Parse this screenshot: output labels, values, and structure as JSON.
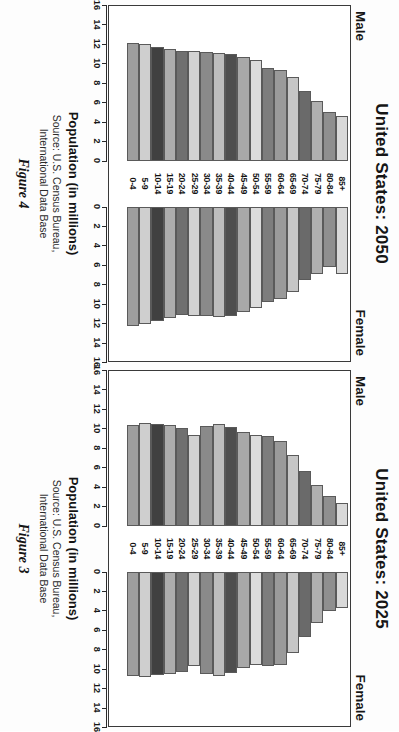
{
  "page": {
    "axis_title": "Population (in millions)",
    "source_line1": "Source: U.S. Census Bureau,",
    "source_line2": "International Data Base",
    "male_label": "Male",
    "female_label": "Female"
  },
  "panels": [
    {
      "id": "us-2025",
      "title": "United States: 2025",
      "figure_caption": "Figure 3"
    },
    {
      "id": "us-2050",
      "title": "United States: 2050",
      "figure_caption": "Figure 4"
    }
  ],
  "chart_data": [
    {
      "type": "bar",
      "title": "United States: 2025",
      "subtitle": "Figure 3",
      "orientation": "horizontal",
      "layout": "population-pyramid",
      "xlabel": "Population (in millions)",
      "ylabel": "",
      "xlim": [
        0,
        16
      ],
      "xticks": [
        0,
        2,
        4,
        6,
        8,
        10,
        12,
        14,
        16
      ],
      "xtick_labels": [
        "0",
        "2",
        "4",
        "6",
        "8",
        "10",
        "12",
        "14",
        "16"
      ],
      "grid": false,
      "legend": [
        "Male",
        "Female"
      ],
      "legend_position": "top-outside",
      "categories": [
        "85+",
        "80-84",
        "75-79",
        "70-74",
        "65-69",
        "60-64",
        "55-59",
        "50-54",
        "45-49",
        "40-44",
        "35-39",
        "30-34",
        "25-29",
        "20-24",
        "15-19",
        "10-14",
        "5-9",
        "0-4"
      ],
      "series": [
        {
          "name": "Male",
          "values": [
            2.3,
            3.0,
            4.2,
            5.6,
            7.3,
            8.7,
            9.2,
            9.3,
            9.6,
            10.1,
            10.4,
            10.2,
            9.3,
            10.0,
            10.3,
            10.4,
            10.5,
            10.3
          ]
        },
        {
          "name": "Female",
          "values": [
            3.8,
            4.1,
            5.3,
            6.7,
            8.4,
            9.6,
            9.7,
            9.6,
            9.9,
            10.4,
            10.8,
            10.5,
            9.7,
            10.3,
            10.5,
            10.7,
            10.9,
            10.8
          ]
        }
      ],
      "annotations": [
        "Source: U.S. Census Bureau, International Data Base"
      ]
    },
    {
      "type": "bar",
      "title": "United States: 2050",
      "subtitle": "Figure 4",
      "orientation": "horizontal",
      "layout": "population-pyramid",
      "xlabel": "Population (in millions)",
      "ylabel": "",
      "xlim": [
        0,
        16
      ],
      "xticks": [
        0,
        2,
        4,
        6,
        8,
        10,
        12,
        14,
        16
      ],
      "xtick_labels": [
        "0",
        "2",
        "4",
        "6",
        "8",
        "10",
        "12",
        "14",
        "16"
      ],
      "grid": false,
      "legend": [
        "Male",
        "Female"
      ],
      "legend_position": "top-outside",
      "categories": [
        "85+",
        "80-84",
        "75-79",
        "70-74",
        "65-69",
        "60-64",
        "55-59",
        "50-54",
        "45-49",
        "40-44",
        "35-39",
        "30-34",
        "25-29",
        "20-24",
        "15-19",
        "10-14",
        "5-9",
        "0-4"
      ],
      "series": [
        {
          "name": "Male",
          "values": [
            4.6,
            5.0,
            6.1,
            7.2,
            8.6,
            9.3,
            9.5,
            10.3,
            10.7,
            11.0,
            11.1,
            11.2,
            11.3,
            11.3,
            11.5,
            11.7,
            12.0,
            12.1
          ]
        },
        {
          "name": "Female",
          "values": [
            6.9,
            6.2,
            6.9,
            7.6,
            8.8,
            9.5,
            9.8,
            10.4,
            10.9,
            11.3,
            11.4,
            11.3,
            11.3,
            11.2,
            11.5,
            11.8,
            12.1,
            12.3
          ]
        }
      ],
      "annotations": [
        "Source: U.S. Census Bureau, International Data Base"
      ]
    }
  ],
  "bar_shades": [
    "#d9d9d9",
    "#8f8f8f",
    "#b0b0b0",
    "#6a6a6a",
    "#c6c6c6",
    "#9a9a9a",
    "#7d7d7d",
    "#dcdcdc",
    "#a8a8a8",
    "#4e4e4e",
    "#bdbdbd",
    "#8a8a8a",
    "#d2d2d2",
    "#707070",
    "#adadad",
    "#404040",
    "#cfcfcf",
    "#9e9e9e"
  ]
}
